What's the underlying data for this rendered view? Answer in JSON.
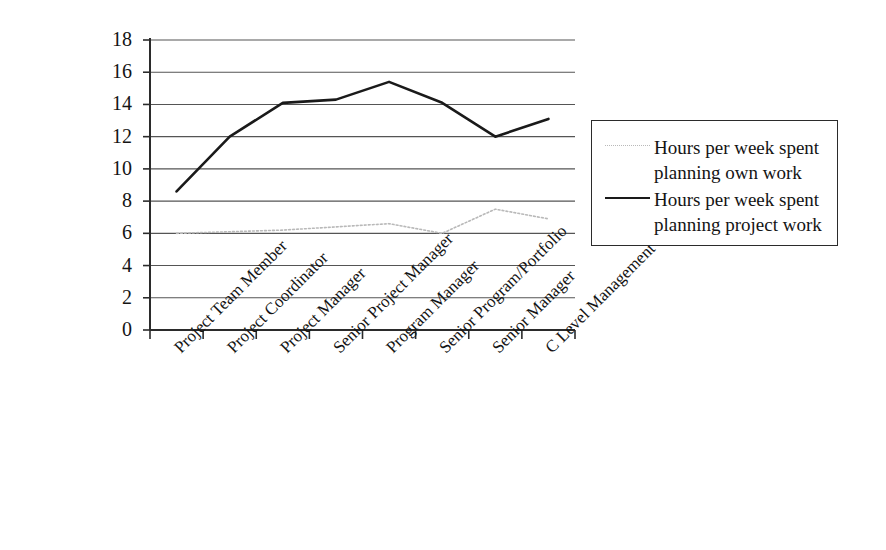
{
  "chart_data": {
    "type": "line",
    "title": "",
    "subtitle": "",
    "xlabel": "",
    "ylabel": "",
    "grid": true,
    "legend_position": "right",
    "ylim": [
      0,
      18
    ],
    "yticks": [
      0,
      2,
      4,
      6,
      8,
      10,
      12,
      14,
      16,
      18
    ],
    "ytick_labels": [
      "0",
      "2",
      "4",
      "6",
      "8",
      "10",
      "12",
      "14",
      "16",
      "18"
    ],
    "categories": [
      "Project Team Member",
      "Project Coordinator",
      "Project Manager",
      "Senior Project Manager",
      "Program Manager",
      "Senior Program/Portfolio",
      "Senior Manager",
      "C Level Management"
    ],
    "series": [
      {
        "name": "Hours per week spent planning own work",
        "values": [
          6.0,
          6.1,
          6.2,
          6.4,
          6.6,
          6.0,
          7.5,
          6.9
        ],
        "color": "#b9b9b9",
        "style": "dotted",
        "width": 1.6
      },
      {
        "name": "Hours per week spent planning project work",
        "values": [
          8.6,
          12.0,
          14.1,
          14.3,
          15.4,
          14.1,
          12.0,
          13.1
        ],
        "color": "#1a1a1a",
        "style": "solid",
        "width": 2.6
      }
    ]
  },
  "legend": {
    "entries": [
      {
        "line1": "Hours per week spent",
        "line2": "planning own work"
      },
      {
        "line1": "Hours per week spent",
        "line2": "planning project work"
      }
    ]
  },
  "axes": {
    "axis_color": "#2b2b2b",
    "grid_color": "#555555"
  }
}
